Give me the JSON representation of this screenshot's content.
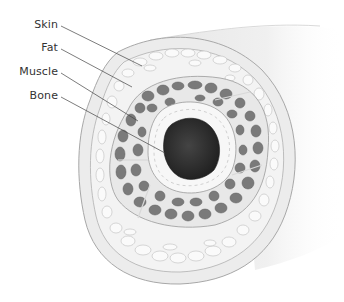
{
  "diagram": {
    "labels": [
      {
        "id": "skin",
        "text": "Skin"
      },
      {
        "id": "fat",
        "text": "Fat"
      },
      {
        "id": "muscle",
        "text": "Muscle"
      },
      {
        "id": "bone",
        "text": "Bone"
      }
    ],
    "colors": {
      "background": "#ffffff",
      "label_text": "#333333",
      "leader_line": "#444444",
      "skin": "#ececec",
      "fat": "#f3f3f3",
      "fat_outline": "#b8b8b8",
      "muscle_fascicle": "#7a7a7a",
      "muscle_septa": "#e8e8e8",
      "periosteum": "#f7f7f7",
      "marrow": "#2e2e2e"
    }
  }
}
